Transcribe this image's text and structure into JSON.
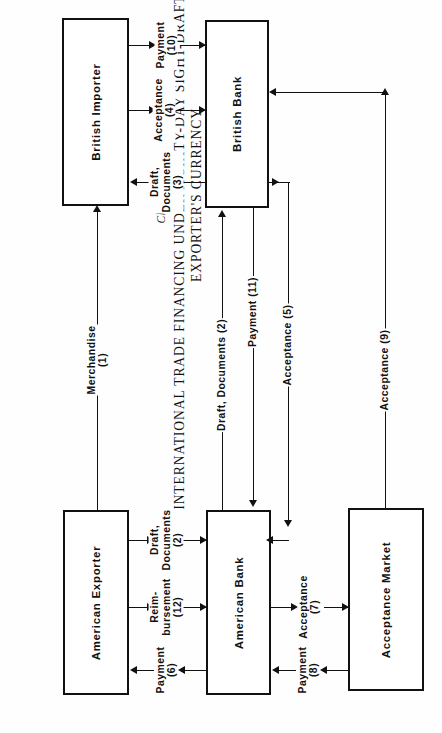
{
  "header": {
    "chart_number": "Chart 28-1",
    "title_line1": "INTERNATIONAL TRADE FINANCING UNDER A SIXTY-DAY SIGHT-DRAFT TRANSACTION:",
    "title_line2": "EXPORTER'S CURRENCY"
  },
  "nodes": [
    {
      "id": "british-importer",
      "label": "British Importer"
    },
    {
      "id": "british-bank",
      "label": "British Bank"
    },
    {
      "id": "american-exporter",
      "label": "American Exporter"
    },
    {
      "id": "american-bank",
      "label": "American Bank"
    },
    {
      "id": "acceptance-market",
      "label": "Acceptance Market"
    }
  ],
  "flows": [
    {
      "id": "payment-10",
      "line1": "Payment",
      "line2": "(10)",
      "direction": "right"
    },
    {
      "id": "acceptance-4",
      "line1": "Acceptance",
      "line2": "(4)",
      "direction": "right"
    },
    {
      "id": "draft-docs-3",
      "line1": "Draft,",
      "line2": "Documents",
      "line3": "(3)",
      "direction": "left"
    },
    {
      "id": "merchandise-1",
      "line1": "Merchandise",
      "line2": "(1)",
      "direction": "up"
    },
    {
      "id": "draft-docs-2-vert",
      "line1": "Draft, Documents (2)",
      "direction": "up"
    },
    {
      "id": "payment-11",
      "line1": "Payment (11)",
      "direction": "down"
    },
    {
      "id": "acceptance-5",
      "line1": "Acceptance (5)",
      "direction": "down"
    },
    {
      "id": "acceptance-9",
      "line1": "Acceptance (9)",
      "direction": "up"
    },
    {
      "id": "draft-docs-2",
      "line1": "Draft,",
      "line2": "Documents",
      "line3": "(2)",
      "direction": "right"
    },
    {
      "id": "reimbursement-12",
      "line1": "Reim-",
      "line2": "bursement",
      "line3": "(12)",
      "direction": "right"
    },
    {
      "id": "payment-6",
      "line1": "Payment",
      "line2": "(6)",
      "direction": "left"
    },
    {
      "id": "acceptance-7",
      "line1": "Acceptance",
      "line2": "(7)",
      "direction": "right"
    },
    {
      "id": "payment-8",
      "line1": "Payment",
      "line2": "(8)",
      "direction": "left"
    }
  ],
  "colors": {
    "stroke": "#111111",
    "background": "#fefefe"
  }
}
